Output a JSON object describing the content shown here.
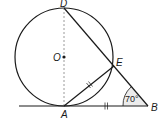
{
  "diagram": {
    "type": "geometry",
    "points": {
      "D": {
        "label": "D",
        "x": 64,
        "y": 8
      },
      "O": {
        "label": "O",
        "x": 64,
        "y": 57
      },
      "E": {
        "label": "E",
        "x": 114,
        "y": 66
      },
      "A": {
        "label": "A",
        "x": 64,
        "y": 106
      },
      "B": {
        "label": "B",
        "x": 148,
        "y": 106
      }
    },
    "circle": {
      "center": "O",
      "radius": 49
    },
    "segments": [
      {
        "from": "D",
        "to": "A",
        "style": "dashed"
      },
      {
        "from": "D",
        "to": "B",
        "style": "solid"
      },
      {
        "from": "A",
        "to": "E",
        "style": "solid",
        "tick_marks": 2
      },
      {
        "from": "A",
        "to": "B",
        "style": "solid",
        "tick_marks": 2
      }
    ],
    "tangent_line": {
      "from_x": 19,
      "to": "B"
    },
    "angle": {
      "vertex": "B",
      "label": "70°",
      "value": 70
    }
  },
  "colors": {
    "stroke": "#1a1a1a",
    "dashed": "#9a9a9a",
    "angle_fill": "#e6e6e6"
  }
}
